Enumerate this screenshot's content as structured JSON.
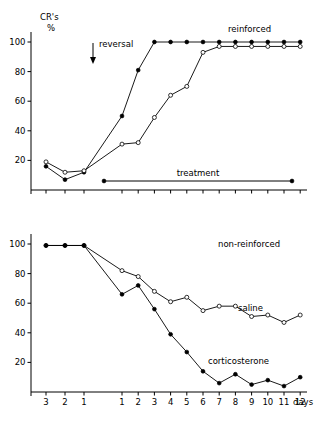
{
  "figure": {
    "yaxis_label_line1": "CR's",
    "yaxis_label_line2": "%",
    "xaxis_label": "days",
    "y_ticks": [
      20,
      40,
      60,
      80,
      100
    ],
    "x_tick_labels_pre": [
      "3",
      "2",
      "1"
    ],
    "x_tick_labels_post": [
      "1",
      "2",
      "3",
      "4",
      "5",
      "6",
      "7",
      "8",
      "9",
      "10",
      "11",
      "12"
    ]
  },
  "panels": {
    "top": {
      "title": "reinforced",
      "annotation_reversal": "reversal",
      "annotation_treatment": "treatment"
    },
    "bottom": {
      "title": "non-reinforced",
      "label_saline": "saline",
      "label_corticosterone": "corticosterone"
    }
  },
  "chart_data": [
    {
      "type": "line",
      "title": "reinforced",
      "xlabel": "",
      "ylabel": "CR's %",
      "ylim": [
        0,
        105
      ],
      "grid": false,
      "legend": "inline-annotation",
      "annotations": [
        {
          "text": "reversal",
          "x_category": "1",
          "note": "downward arrow marking reversal onset at end of pre-period"
        },
        {
          "text": "treatment",
          "x_from": "1",
          "x_to": "12",
          "note": "horizontal bar spanning treatment days 1-12"
        },
        {
          "text": "reinforced",
          "note": "panel title, upper right"
        }
      ],
      "categories": [
        "pre3",
        "pre2",
        "pre1",
        "1",
        "2",
        "3",
        "4",
        "5",
        "6",
        "7",
        "8",
        "9",
        "10",
        "11",
        "12"
      ],
      "tick_labels": [
        "3",
        "2",
        "1",
        "1",
        "2",
        "3",
        "4",
        "5",
        "6",
        "7",
        "8",
        "9",
        "10",
        "11",
        "12"
      ],
      "series": [
        {
          "name": "corticosterone",
          "marker": "filled-circle",
          "values": [
            16,
            7,
            12,
            50,
            81,
            100,
            100,
            100,
            100,
            100,
            100,
            100,
            100,
            100,
            100
          ]
        },
        {
          "name": "saline",
          "marker": "open-circle",
          "values": [
            19,
            12,
            13,
            31,
            32,
            49,
            64,
            70,
            93,
            97,
            97,
            97,
            97,
            97,
            97
          ]
        }
      ]
    },
    {
      "type": "line",
      "title": "non-reinforced",
      "xlabel": "days",
      "ylabel": "CR's %",
      "ylim": [
        0,
        105
      ],
      "grid": false,
      "legend": "inline-labels",
      "annotations": [
        {
          "text": "non-reinforced",
          "note": "panel title, upper right"
        },
        {
          "text": "saline",
          "note": "series label on open-circle curve"
        },
        {
          "text": "corticosterone",
          "note": "series label on filled-circle curve"
        }
      ],
      "categories": [
        "pre3",
        "pre2",
        "pre1",
        "1",
        "2",
        "3",
        "4",
        "5",
        "6",
        "7",
        "8",
        "9",
        "10",
        "11",
        "12"
      ],
      "tick_labels": [
        "3",
        "2",
        "1",
        "1",
        "2",
        "3",
        "4",
        "5",
        "6",
        "7",
        "8",
        "9",
        "10",
        "11",
        "12"
      ],
      "series": [
        {
          "name": "saline",
          "marker": "open-circle",
          "values": [
            99,
            99,
            99,
            82,
            78,
            68,
            61,
            64,
            55,
            58,
            58,
            51,
            52,
            47,
            52
          ]
        },
        {
          "name": "corticosterone",
          "marker": "filled-circle",
          "values": [
            99,
            99,
            99,
            66,
            72,
            56,
            39,
            27,
            14,
            6,
            12,
            5,
            8,
            4,
            10
          ]
        }
      ]
    }
  ]
}
